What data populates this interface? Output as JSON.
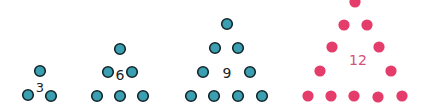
{
  "figure": {
    "colors": {
      "teal_fill": "#3a9fb1",
      "teal_stroke": "#15262b",
      "pink_fill": "#e43d6b",
      "pink_label": "#d4507c",
      "dark_label": "#222222",
      "background": "#ffffff"
    },
    "triangles": [
      {
        "label": "3",
        "color": "teal",
        "label_pos": [
          40,
          92
        ],
        "label_size": 13,
        "dots": [
          [
            40,
            71
          ],
          [
            28,
            95
          ],
          [
            51,
            96
          ]
        ]
      },
      {
        "label": "6",
        "color": "teal",
        "label_pos": [
          120,
          80
        ],
        "label_size": 14,
        "dots": [
          [
            120,
            49
          ],
          [
            108,
            72
          ],
          [
            132,
            72
          ],
          [
            97,
            96
          ],
          [
            120,
            96
          ],
          [
            143,
            96
          ]
        ]
      },
      {
        "label": "9",
        "color": "teal",
        "label_pos": [
          227,
          78
        ],
        "label_size": 14,
        "dots": [
          [
            227,
            24
          ],
          [
            215,
            48
          ],
          [
            238,
            48
          ],
          [
            203,
            72
          ],
          [
            250,
            72
          ],
          [
            191,
            96
          ],
          [
            214,
            96
          ],
          [
            238,
            96
          ],
          [
            262,
            96
          ]
        ]
      },
      {
        "label": "12",
        "color": "pink",
        "label_pos": [
          358,
          65
        ],
        "label_size": 14,
        "dots": [
          [
            355,
            2
          ],
          [
            344,
            25
          ],
          [
            367,
            25
          ],
          [
            332,
            47
          ],
          [
            379,
            47
          ],
          [
            320,
            71
          ],
          [
            391,
            71
          ],
          [
            308,
            96
          ],
          [
            331,
            96
          ],
          [
            354,
            96
          ],
          [
            378,
            97
          ],
          [
            402,
            96
          ]
        ]
      }
    ]
  }
}
